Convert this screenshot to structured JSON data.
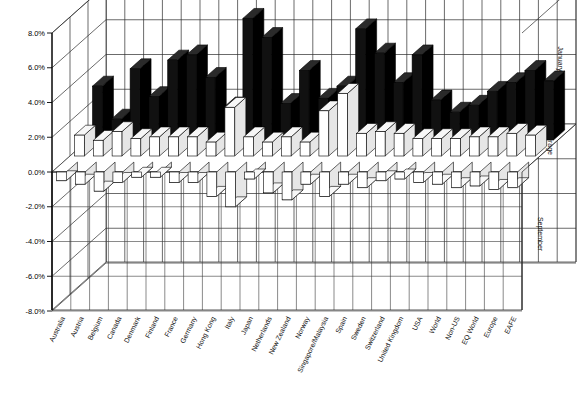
{
  "header": {
    "title": "",
    "title_faint": "  .             .  .                    ."
  },
  "chart_data": {
    "type": "bar",
    "subtype": "3d-clustered-bar",
    "title": "",
    "xlabel": "",
    "ylabel": "",
    "ylim": [
      -8.0,
      8.0
    ],
    "ytick_step": 2.0,
    "ytick_labels": [
      "8.0%",
      "6.0%",
      "4.0%",
      "2.0%",
      "0.0%",
      "-2.0%",
      "-4.0%",
      "-6.0%",
      "-8.0%"
    ],
    "ytick_values": [
      8.0,
      6.0,
      4.0,
      2.0,
      0.0,
      -2.0,
      -4.0,
      -6.0,
      -8.0
    ],
    "grid": true,
    "legend_position": "right-depth-axis",
    "depth_axis_labels": [
      "January",
      "Average",
      "September"
    ],
    "categories": [
      "Australia",
      "Austria",
      "Belgium",
      "Canada",
      "Denmark",
      "Finland",
      "France",
      "Germany",
      "Hong Kong",
      "Italy",
      "Japan",
      "Netherlands",
      "New Zealand",
      "Norway",
      "Singapore/Malaysia",
      "Spain",
      "Sweden",
      "Switzerland",
      "United Kingdom",
      "USA",
      "World",
      "Non-US",
      "EQ World",
      "Europe",
      "EAFE"
    ],
    "series": [
      {
        "name": "January",
        "color": "#111111",
        "values": [
          3.1,
          1.2,
          4.1,
          2.5,
          4.6,
          4.9,
          3.6,
          1.9,
          7.0,
          5.9,
          2.1,
          4.0,
          2.4,
          3.1,
          6.4,
          5.0,
          3.3,
          4.9,
          2.3,
          1.6,
          2.0,
          2.8,
          3.3,
          4.0,
          3.4
        ]
      },
      {
        "name": "Average",
        "color": "#ffffff",
        "values": [
          1.2,
          0.9,
          1.4,
          1.0,
          1.1,
          1.1,
          1.1,
          0.8,
          2.8,
          1.1,
          0.8,
          1.1,
          0.8,
          2.6,
          3.6,
          1.3,
          1.4,
          1.3,
          1.0,
          1.0,
          1.0,
          1.1,
          1.1,
          1.3,
          1.2
        ]
      },
      {
        "name": "September",
        "color": "#ffffff",
        "values": [
          -0.5,
          -0.7,
          -1.1,
          -0.6,
          -0.3,
          -0.3,
          -0.6,
          -0.6,
          -1.4,
          -2.0,
          -0.4,
          -1.2,
          -1.6,
          -0.7,
          -1.4,
          -0.7,
          -0.9,
          -0.5,
          -0.4,
          -0.6,
          -0.7,
          -0.9,
          -0.8,
          -1.0,
          -0.9
        ]
      }
    ]
  }
}
